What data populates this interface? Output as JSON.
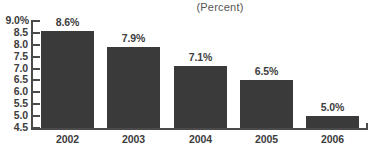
{
  "chart_data": {
    "type": "bar",
    "title": "(Percent)",
    "xlabel": "",
    "ylabel": "",
    "categories": [
      "2002",
      "2003",
      "2004",
      "2005",
      "2006"
    ],
    "values": [
      8.6,
      7.9,
      7.1,
      6.5,
      5.0
    ],
    "data_labels": [
      "8.6%",
      "7.9%",
      "7.1%",
      "6.5%",
      "5.0%"
    ],
    "ylim": [
      4.5,
      9.0
    ],
    "ytick_values": [
      9.0,
      8.5,
      8.0,
      7.5,
      7.0,
      6.5,
      6.0,
      5.5,
      5.0,
      4.5
    ],
    "ytick_labels": [
      "9.0%",
      "8.5",
      "8.0",
      "7.5",
      "7.0",
      "6.5",
      "6.0",
      "5.5",
      "5.0",
      "4.5"
    ],
    "grid": false,
    "legend": null,
    "bar_color": "#3a3a3a",
    "axis_color": "#4a4a4a",
    "text_color": "#3d3d3d",
    "title_color": "#555555",
    "background": "#ffffff"
  }
}
